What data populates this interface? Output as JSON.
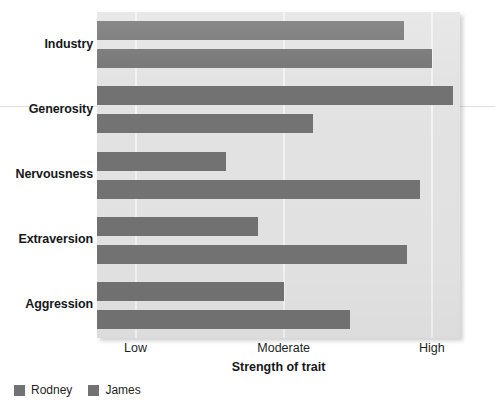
{
  "chart_data": {
    "type": "bar",
    "orientation": "horizontal",
    "title": "",
    "xlabel": "Strength of trait",
    "ylabel": "",
    "categories": [
      "Industry",
      "Generosity",
      "Nervousness",
      "Extraversion",
      "Aggression"
    ],
    "xtick_labels": [
      "Low",
      "Moderate",
      "High"
    ],
    "xtick_values": [
      1,
      2,
      3
    ],
    "xlim": [
      0.74,
      3.19
    ],
    "grid": "vertical-gridlines-only",
    "legend_position": "below-axes-left",
    "series": [
      {
        "name": "Rodney",
        "color": "#727272",
        "values": [
          2.81,
          3.14,
          1.61,
          1.83,
          2.0
        ]
      },
      {
        "name": "James",
        "color": "#737373",
        "values": [
          3.0,
          2.2,
          2.92,
          2.83,
          2.45
        ]
      }
    ]
  },
  "axis": {
    "x_title": "Strength of trait",
    "ticks": [
      {
        "label": "Low",
        "value": 1
      },
      {
        "label": "Moderate",
        "value": 2
      },
      {
        "label": "High",
        "value": 3
      }
    ]
  },
  "categories": [
    {
      "label": "Industry"
    },
    {
      "label": "Generosity"
    },
    {
      "label": "Nervousness"
    },
    {
      "label": "Extraversion"
    },
    {
      "label": "Aggression"
    }
  ],
  "legend": {
    "items": [
      {
        "label": "Rodney",
        "color": "#727272"
      },
      {
        "label": "James",
        "color": "#737373"
      }
    ]
  }
}
